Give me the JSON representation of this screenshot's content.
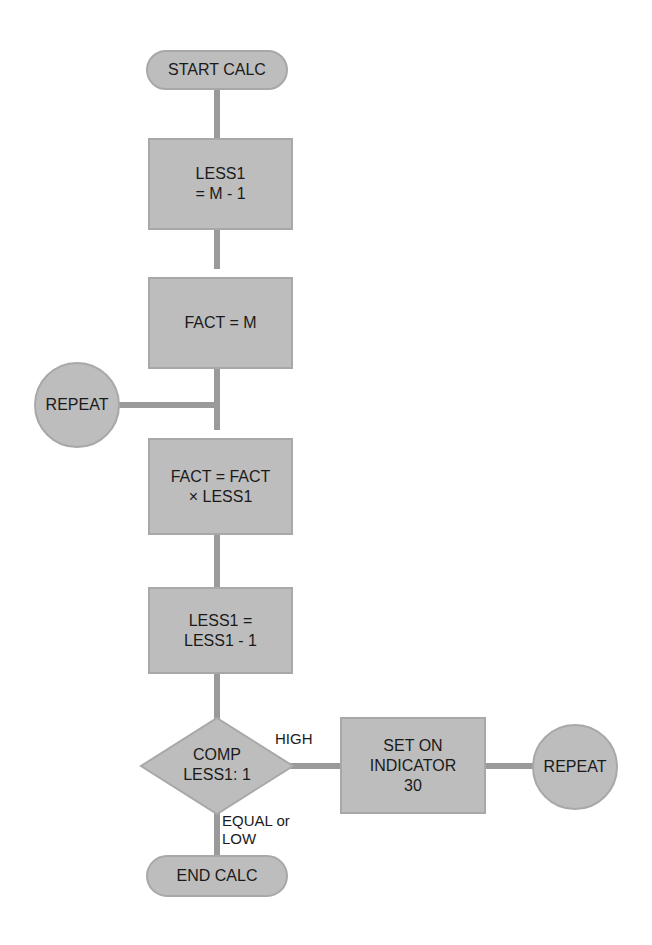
{
  "diagram": {
    "type": "flowchart",
    "nodes": {
      "start": {
        "shape": "terminal",
        "text": "START CALC"
      },
      "less1_init": {
        "shape": "process",
        "text": "LESS1\n= M - 1"
      },
      "fact_init": {
        "shape": "process",
        "text": "FACT  =  M"
      },
      "repeat_left": {
        "shape": "connector",
        "text": "REPEAT"
      },
      "fact_mult": {
        "shape": "process",
        "text": "FACT = FACT\n× LESS1"
      },
      "less1_dec": {
        "shape": "process",
        "text": "LESS1 =\nLESS1 - 1"
      },
      "compare": {
        "shape": "decision",
        "text": "COMP\nLESS1: 1"
      },
      "set_indicator": {
        "shape": "process",
        "text": "SET ON\nINDICATOR\n30"
      },
      "repeat_right": {
        "shape": "connector",
        "text": "REPEAT"
      },
      "end": {
        "shape": "terminal",
        "text": "END CALC"
      }
    },
    "edge_labels": {
      "high": "HIGH",
      "equal_or_low": "EQUAL or\nLOW"
    },
    "colors": {
      "fill": "#bdbdbd",
      "stroke": "#a8a8a8",
      "connector_line": "#9a9a9a",
      "text": "#1a1a1a"
    }
  }
}
